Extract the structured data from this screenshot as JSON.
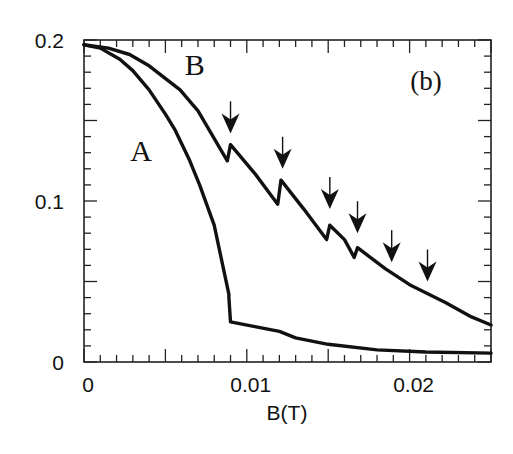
{
  "chart_data": {
    "type": "line",
    "title": "",
    "panel_label": "(b)",
    "xlabel": "B(T)",
    "ylabel": "",
    "xlim": [
      0,
      0.025
    ],
    "ylim": [
      0,
      0.2
    ],
    "grid": false,
    "legend": "none (curves labelled inline)",
    "x_tick_labels": [
      "0",
      "0.01",
      "0.02"
    ],
    "x_ticks": [
      0,
      0.01,
      0.02
    ],
    "x_minor_step": 0.001,
    "y_tick_labels": [
      "0",
      "0.1",
      "0.2"
    ],
    "y_ticks": [
      0,
      0.1,
      0.2
    ],
    "y_minor_step": 0.01,
    "series": [
      {
        "name": "A",
        "label_pos": [
          0.0035,
          0.125
        ],
        "points": [
          [
            0,
            0.197
          ],
          [
            0.001,
            0.195
          ],
          [
            0.0022,
            0.188
          ],
          [
            0.003,
            0.181
          ],
          [
            0.004,
            0.169
          ],
          [
            0.005,
            0.154
          ],
          [
            0.0056,
            0.144
          ],
          [
            0.0065,
            0.125
          ],
          [
            0.0071,
            0.11
          ],
          [
            0.008,
            0.085
          ],
          [
            0.0089,
            0.042
          ],
          [
            0.0089,
            0.04
          ],
          [
            0.009,
            0.025
          ],
          [
            0.0105,
            0.022
          ],
          [
            0.012,
            0.019
          ],
          [
            0.013,
            0.015
          ],
          [
            0.015,
            0.011
          ],
          [
            0.018,
            0.0075
          ],
          [
            0.021,
            0.0062
          ],
          [
            0.025,
            0.0055
          ]
        ]
      },
      {
        "name": "B",
        "label_pos": [
          0.0068,
          0.178
        ],
        "points": [
          [
            0,
            0.197
          ],
          [
            0.0015,
            0.195
          ],
          [
            0.0028,
            0.191
          ],
          [
            0.004,
            0.184
          ],
          [
            0.0059,
            0.169
          ],
          [
            0.007,
            0.156
          ],
          [
            0.0088,
            0.125
          ],
          [
            0.009,
            0.135
          ],
          [
            0.0105,
            0.117
          ],
          [
            0.0119,
            0.098
          ],
          [
            0.0121,
            0.113
          ],
          [
            0.0135,
            0.095
          ],
          [
            0.0149,
            0.076
          ],
          [
            0.0151,
            0.085
          ],
          [
            0.016,
            0.076
          ],
          [
            0.0166,
            0.065
          ],
          [
            0.0168,
            0.071
          ],
          [
            0.0185,
            0.058
          ],
          [
            0.02,
            0.048
          ],
          [
            0.0222,
            0.037
          ],
          [
            0.0238,
            0.028
          ],
          [
            0.025,
            0.023
          ]
        ]
      }
    ],
    "annotations": {
      "arrows_on_B_at_x": [
        0.009,
        0.0122,
        0.0151,
        0.0168,
        0.0189,
        0.0211
      ],
      "arrow_tip_y": [
        0.142,
        0.12,
        0.095,
        0.08,
        0.062,
        0.05
      ]
    }
  }
}
